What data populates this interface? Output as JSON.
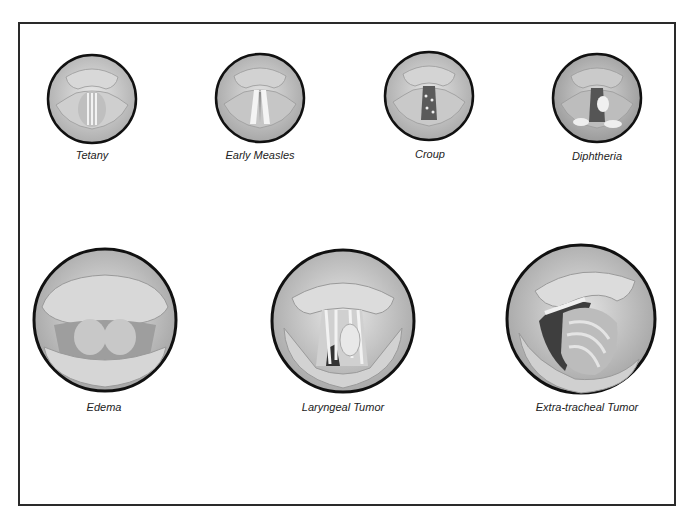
{
  "figure": {
    "type": "anatomical-illustration-plate",
    "colors": {
      "frame": "#2a2a2a",
      "circle_outline": "#111111",
      "tissue_light": "#e6e6e6",
      "tissue_mid": "#bdbdbd",
      "tissue_dark": "#6e6e6e",
      "airway_dark": "#3a3a3a"
    },
    "rows": [
      {
        "row": "top",
        "items": [
          {
            "id": "tetany",
            "label": "Tetany",
            "cx": 92,
            "cy": 99,
            "r": 46
          },
          {
            "id": "early-measles",
            "label": "Early Measles",
            "cx": 260,
            "cy": 98,
            "r": 46
          },
          {
            "id": "croup",
            "label": "Croup",
            "cx": 429,
            "cy": 96,
            "r": 46
          },
          {
            "id": "diphtheria",
            "label": "Diphtheria",
            "cx": 597,
            "cy": 98,
            "r": 46
          }
        ]
      },
      {
        "row": "bottom",
        "items": [
          {
            "id": "edema",
            "label": "Edema",
            "cx": 105,
            "cy": 320,
            "r": 73
          },
          {
            "id": "laryngeal-tumor",
            "label": "Laryngeal Tumor",
            "cx": 343,
            "cy": 321,
            "r": 73
          },
          {
            "id": "extra-tracheal-tumor",
            "label": "Extra-tracheal Tumor",
            "cx": 581,
            "cy": 319,
            "r": 76
          }
        ]
      }
    ]
  }
}
